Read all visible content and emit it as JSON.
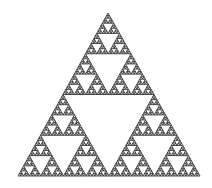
{
  "figure": {
    "depth": 6,
    "apex": [
      108,
      13
    ],
    "left": [
      18,
      176
    ],
    "right": [
      200,
      176
    ],
    "fill_color": "#333333",
    "hole_color": "#ffffff",
    "background": "#ffffff"
  }
}
